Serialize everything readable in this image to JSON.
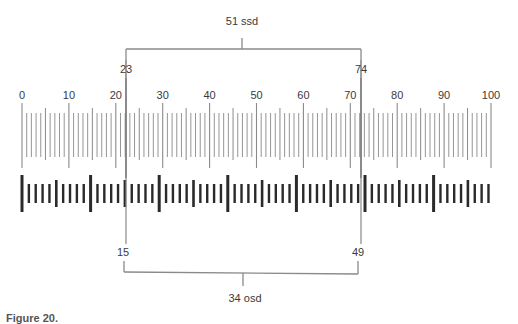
{
  "figure": {
    "ssd_label": "51 ssd",
    "osd_label": "34 osd",
    "caption": "Figure 20.",
    "upper_scale": {
      "name": "stage micrometer",
      "tick_labels": [
        "0",
        "10",
        "20",
        "30",
        "40",
        "50",
        "60",
        "70",
        "80",
        "90",
        "100"
      ],
      "min": 0,
      "max": 100,
      "marker_left": "23",
      "marker_right": "74"
    },
    "lower_scale": {
      "name": "ocular micrometer",
      "marker_left": "15",
      "marker_right": "49"
    },
    "colors": {
      "upper_tick": "#8a8a8a",
      "lower_bar": "#2a2a2a",
      "bracket": "#8a8a8a"
    }
  }
}
